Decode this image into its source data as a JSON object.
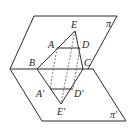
{
  "diagram": {
    "type": "geometry-two-planes",
    "planes": [
      {
        "name": "upper-plane",
        "label": "π"
      },
      {
        "name": "lower-plane",
        "label": "π'"
      }
    ],
    "points": {
      "E": "E",
      "A": "A",
      "D": "D",
      "B": "B",
      "C": "C",
      "A_prime": "A'",
      "D_prime": "D'",
      "E_prime": "E'"
    },
    "colors": {
      "stroke": "#2a2a2a",
      "background": "#ffffff"
    }
  }
}
